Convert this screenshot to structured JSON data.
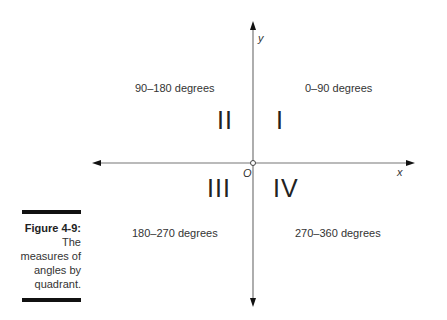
{
  "caption": {
    "figure_label": "Figure 4-9:",
    "lines": [
      "The",
      "measures of",
      "angles by",
      "quadrant."
    ]
  },
  "axes": {
    "x_label": "x",
    "y_label": "y",
    "origin_label": "O"
  },
  "quadrants": [
    {
      "numeral": "I",
      "range": "0–90 degrees"
    },
    {
      "numeral": "II",
      "range": "90–180 degrees"
    },
    {
      "numeral": "III",
      "range": "180–270 degrees"
    },
    {
      "numeral": "IV",
      "range": "270–360 degrees"
    }
  ]
}
